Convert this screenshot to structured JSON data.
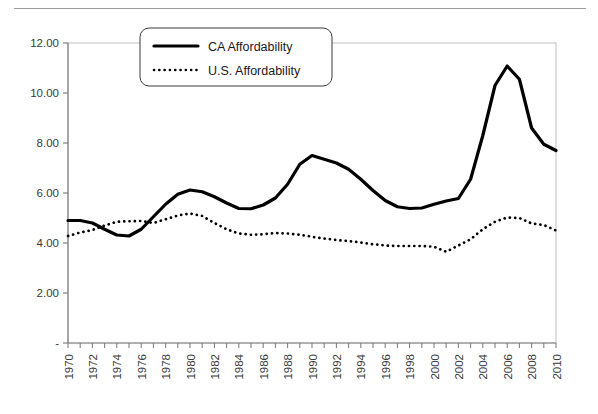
{
  "page": {
    "background": "#ffffff",
    "top_rule_color": "#9b9b9b"
  },
  "legend": {
    "position": "top-center-inside",
    "border_color": "#3a3a3a",
    "entries": [
      {
        "label": "CA Affordability",
        "style": "solid",
        "color": "#000000",
        "width": 3.2
      },
      {
        "label": "U.S. Affordability",
        "style": "dotted",
        "color": "#000000",
        "width": 2.6
      }
    ]
  },
  "axes": {
    "y_ticks": [
      "12.00",
      "10.00",
      "8.00",
      "6.00",
      "4.00",
      "2.00",
      "-"
    ],
    "y_tick_values": [
      12,
      10,
      8,
      6,
      4,
      2,
      0
    ],
    "x_ticks": [
      "1970",
      "1972",
      "1974",
      "1976",
      "1978",
      "1980",
      "1982",
      "1984",
      "1986",
      "1988",
      "1990",
      "1992",
      "1994",
      "1996",
      "1998",
      "2000",
      "2002",
      "2004",
      "2006",
      "2008",
      "2010"
    ],
    "x_label_rotation": -90,
    "axis_color": "#808080",
    "plot_border_color": "#bfbfbf"
  },
  "chart_data": {
    "type": "line",
    "title": "",
    "subtitle": "",
    "xlabel": "",
    "ylabel": "",
    "xlim": [
      1970,
      2010
    ],
    "ylim": [
      0,
      12
    ],
    "grid": false,
    "legend_position": "top-center",
    "x": [
      1970,
      1971,
      1972,
      1973,
      1974,
      1975,
      1976,
      1977,
      1978,
      1979,
      1980,
      1981,
      1982,
      1983,
      1984,
      1985,
      1986,
      1987,
      1988,
      1989,
      1990,
      1991,
      1992,
      1993,
      1994,
      1995,
      1996,
      1997,
      1998,
      1999,
      2000,
      2001,
      2002,
      2003,
      2004,
      2005,
      2006,
      2007,
      2008,
      2009,
      2010
    ],
    "series": [
      {
        "name": "CA Affordability",
        "style": "solid",
        "color": "#000000",
        "values": [
          4.9,
          4.9,
          4.8,
          4.55,
          4.32,
          4.28,
          4.55,
          5.05,
          5.55,
          5.95,
          6.12,
          6.05,
          5.85,
          5.6,
          5.38,
          5.37,
          5.52,
          5.8,
          6.35,
          7.15,
          7.5,
          7.35,
          7.2,
          6.95,
          6.55,
          6.1,
          5.7,
          5.45,
          5.38,
          5.4,
          5.55,
          5.68,
          5.78,
          6.55,
          8.3,
          10.3,
          11.08,
          10.55,
          8.6,
          7.95,
          7.7
        ]
      },
      {
        "name": "U.S. Affordability",
        "style": "dotted",
        "color": "#000000",
        "values": [
          4.28,
          4.42,
          4.52,
          4.7,
          4.85,
          4.87,
          4.88,
          4.8,
          4.95,
          5.1,
          5.18,
          5.08,
          4.8,
          4.55,
          4.38,
          4.33,
          4.35,
          4.4,
          4.38,
          4.33,
          4.25,
          4.18,
          4.12,
          4.08,
          4.02,
          3.95,
          3.9,
          3.88,
          3.88,
          3.88,
          3.85,
          3.65,
          3.9,
          4.15,
          4.55,
          4.85,
          5.02,
          5.0,
          4.78,
          4.72,
          4.5
        ]
      }
    ]
  }
}
